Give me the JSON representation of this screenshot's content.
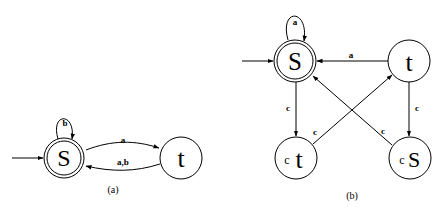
{
  "diagram_a": {
    "caption": "(a)",
    "states": {
      "s": {
        "label": "S",
        "accepting": true,
        "initial": true
      },
      "t": {
        "label": "t",
        "accepting": false
      }
    },
    "edges": {
      "s_loop": "b",
      "s_to_t": "a",
      "t_to_s": "a,b"
    }
  },
  "diagram_b": {
    "caption": "(b)",
    "states": {
      "s": {
        "label": "S",
        "accepting": true,
        "initial": true
      },
      "t": {
        "label": "t",
        "accepting": false
      },
      "ct": {
        "prefix": "c",
        "label": "t",
        "accepting": false
      },
      "cs": {
        "prefix": "c",
        "label": "S",
        "accepting": false
      }
    },
    "edges": {
      "s_loop": "a",
      "t_to_s": "a",
      "s_to_ct": "c",
      "t_to_cs": "c",
      "ct_to_t": "c",
      "cs_to_s": "c"
    }
  }
}
